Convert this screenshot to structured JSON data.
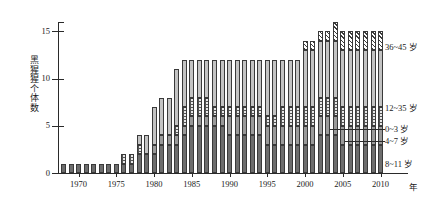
{
  "chart_data": {
    "type": "bar",
    "title": "",
    "subtitle": "",
    "xlabel": "年",
    "ylabel": "黑猩猩个体数",
    "stacked": true,
    "grid": false,
    "legend_position": "right",
    "xlim": [
      1967,
      2011
    ],
    "ylim": [
      0,
      16
    ],
    "yticks": [
      0,
      5,
      10,
      15
    ],
    "ytick_labels": [
      "0",
      "5",
      "10",
      "15"
    ],
    "xticks": [
      1970,
      1975,
      1980,
      1985,
      1990,
      1995,
      2000,
      2005,
      2010
    ],
    "xtick_labels": [
      "1970",
      "1975",
      "1980",
      "1985",
      "1990",
      "1995",
      "2000",
      "2005",
      "2010"
    ],
    "x": [
      1968,
      1969,
      1970,
      1971,
      1972,
      1973,
      1974,
      1975,
      1976,
      1977,
      1978,
      1979,
      1980,
      1981,
      1982,
      1983,
      1984,
      1985,
      1986,
      1987,
      1988,
      1989,
      1990,
      1991,
      1992,
      1993,
      1994,
      1995,
      1996,
      1997,
      1998,
      1999,
      2000,
      2001,
      2002,
      2003,
      2004,
      2005,
      2006,
      2007,
      2008,
      2009,
      2010
    ],
    "series": [
      {
        "name": "0~3 岁",
        "pattern": "solid-dark",
        "color": "#6d6d6d",
        "values": [
          1,
          1,
          1,
          1,
          1,
          1,
          1,
          1,
          1,
          1,
          2,
          2,
          2,
          3,
          3,
          3,
          4,
          5,
          5,
          5,
          5,
          5,
          4,
          4,
          4,
          4,
          4,
          3,
          3,
          3,
          3,
          3,
          3,
          3,
          4,
          4,
          4,
          3,
          3,
          3,
          3,
          3,
          3
        ]
      },
      {
        "name": "4~7 岁",
        "pattern": "solid-mid",
        "color": "#9a9a9a",
        "values": [
          0,
          0,
          0,
          0,
          0,
          0,
          0,
          0,
          0,
          0,
          0,
          0,
          1,
          1,
          1,
          1,
          1,
          1,
          1,
          1,
          1,
          1,
          2,
          2,
          2,
          2,
          2,
          2,
          2,
          2,
          2,
          2,
          2,
          2,
          2,
          2,
          2,
          2,
          2,
          2,
          2,
          2,
          2
        ]
      },
      {
        "name": "8~11 岁",
        "pattern": "stipple",
        "color": "#e8e8e8",
        "values": [
          0,
          0,
          0,
          0,
          0,
          0,
          0,
          0,
          1,
          1,
          1,
          0,
          0,
          0,
          0,
          1,
          2,
          2,
          2,
          2,
          1,
          1,
          1,
          1,
          1,
          1,
          1,
          1,
          1,
          2,
          2,
          2,
          2,
          2,
          2,
          2,
          2,
          2,
          2,
          2,
          2,
          2,
          2
        ]
      },
      {
        "name": "12~35 岁",
        "pattern": "solid-light",
        "color": "#c3c3c3",
        "values": [
          0,
          0,
          0,
          0,
          0,
          0,
          0,
          0,
          0,
          0,
          1,
          2,
          4,
          4,
          4,
          6,
          5,
          4,
          4,
          4,
          5,
          5,
          5,
          5,
          5,
          5,
          5,
          6,
          6,
          5,
          5,
          5,
          6,
          6,
          6,
          6,
          6,
          6,
          6,
          6,
          6,
          6,
          6
        ]
      },
      {
        "name": "36~45 岁",
        "pattern": "hatch",
        "color": "#ffffff",
        "values": [
          0,
          0,
          0,
          0,
          0,
          0,
          0,
          0,
          0,
          0,
          0,
          0,
          0,
          0,
          0,
          0,
          0,
          0,
          0,
          0,
          0,
          0,
          0,
          0,
          0,
          0,
          0,
          0,
          0,
          0,
          0,
          0,
          1,
          1,
          1,
          1,
          2,
          2,
          2,
          2,
          2,
          2,
          2
        ]
      }
    ],
    "totals": [
      1,
      1,
      1,
      1,
      1,
      1,
      1,
      1,
      2,
      2,
      4,
      4,
      7,
      8,
      8,
      11,
      12,
      12,
      12,
      12,
      12,
      12,
      12,
      12,
      12,
      12,
      12,
      12,
      12,
      12,
      12,
      12,
      14,
      14,
      15,
      15,
      16,
      15,
      15,
      15,
      15,
      15,
      15
    ]
  },
  "legend": {
    "items": [
      {
        "label": "36~45 岁",
        "pattern": "hatch"
      },
      {
        "label": "12~35 岁",
        "pattern": "solid-light"
      },
      {
        "label": "0~3 岁",
        "pattern": "solid-dark"
      },
      {
        "label": "4~7 岁",
        "pattern": "solid-mid"
      },
      {
        "label": "8~11 岁",
        "pattern": "stipple"
      }
    ]
  },
  "axis": {
    "y_title": "黑猩猩个体数",
    "x_unit": "年"
  }
}
